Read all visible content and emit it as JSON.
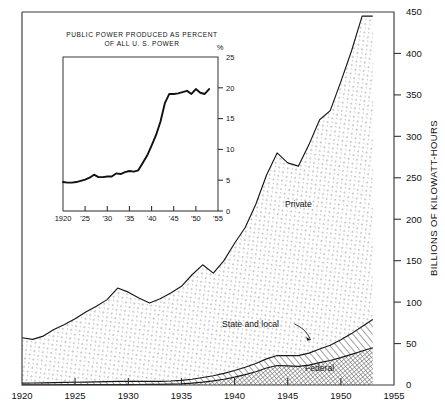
{
  "chart_data": {
    "type": "area",
    "title": "",
    "xlabel": "",
    "ylabel": "BILLIONS OF KILOWATT-HOURS",
    "xlim": [
      1920,
      1955
    ],
    "ylim": [
      0,
      450
    ],
    "xticks": [
      "1920",
      "1925",
      "1930",
      "1935",
      "1940",
      "1945",
      "1950",
      "1955"
    ],
    "yticks": [
      "0",
      "50",
      "100",
      "150",
      "200",
      "250",
      "300",
      "350",
      "400",
      "450"
    ],
    "grid": false,
    "legend_position": "inline-annotations",
    "stacked": true,
    "x": [
      1920,
      1921,
      1922,
      1923,
      1924,
      1925,
      1926,
      1927,
      1928,
      1929,
      1930,
      1931,
      1932,
      1933,
      1934,
      1935,
      1936,
      1937,
      1938,
      1939,
      1940,
      1941,
      1942,
      1943,
      1944,
      1945,
      1946,
      1947,
      1948,
      1949,
      1950,
      1951,
      1952,
      1953
    ],
    "series": [
      {
        "name": "Federal",
        "pattern": "dense-crosshatch",
        "values": [
          0.3,
          0.3,
          0.3,
          0.3,
          0.4,
          0.4,
          0.4,
          0.4,
          0.5,
          0.5,
          0.5,
          0.6,
          0.7,
          0.8,
          1.0,
          1.4,
          2.2,
          3.4,
          5.0,
          7.0,
          9.5,
          12.5,
          16.0,
          20.5,
          23.5,
          23.0,
          22.5,
          24.0,
          27.0,
          29.5,
          33.0,
          37.0,
          41.0,
          45.0
        ]
      },
      {
        "name": "State and local",
        "pattern": "diagonal-hatch",
        "values": [
          2.0,
          2.1,
          2.3,
          2.5,
          2.7,
          2.9,
          3.1,
          3.3,
          3.5,
          3.8,
          3.9,
          3.8,
          3.6,
          3.6,
          3.8,
          4.2,
          4.8,
          5.6,
          6.2,
          7.0,
          8.0,
          9.0,
          10.0,
          11.0,
          12.0,
          12.5,
          13.0,
          14.5,
          16.5,
          18.5,
          21.5,
          25.0,
          29.5,
          34.0
        ]
      },
      {
        "name": "Private",
        "pattern": "fine-dots",
        "values": [
          54.7,
          52.6,
          56.4,
          64.2,
          69.9,
          76.7,
          84.5,
          91.3,
          99.0,
          112.7,
          107.6,
          100.6,
          94.7,
          99.6,
          106.2,
          113.4,
          126.0,
          136.0,
          123.8,
          136.0,
          153.5,
          168.5,
          192.0,
          221.5,
          244.5,
          232.5,
          228.5,
          251.5,
          276.5,
          283.0,
          311.5,
          341.0,
          374.5,
          366.0
        ]
      }
    ],
    "totals": [
      57,
      55,
      59,
      67,
      73,
      80,
      88,
      95,
      103,
      117,
      112,
      105,
      99,
      104,
      111,
      119,
      133,
      145,
      135,
      150,
      171,
      190,
      218,
      253,
      280,
      268,
      264,
      290,
      320,
      331,
      366,
      403,
      445,
      445
    ],
    "annotations": [
      {
        "label": "Private",
        "x": 1946,
        "y": 215
      },
      {
        "label": "State and local",
        "x": 1941.5,
        "y": 70,
        "leader": true
      },
      {
        "label": "Federal",
        "x": 1948,
        "y": 17
      }
    ]
  },
  "inset_chart": {
    "type": "line",
    "title_line1": "PUBLIC POWER PRODUCED AS PERCENT",
    "title_line2": "OF ALL U. S. POWER",
    "unit_symbol": "%",
    "xlabel": "",
    "ylabel": "",
    "xlim": [
      1920,
      1955
    ],
    "ylim": [
      0,
      25
    ],
    "xticks": [
      "1920",
      "'25",
      "'30",
      "'35",
      "'40",
      "'45",
      "'50",
      "'55"
    ],
    "yticks": [
      "0",
      "5",
      "10",
      "15",
      "20",
      "25"
    ],
    "grid": false,
    "x": [
      1920,
      1921,
      1922,
      1923,
      1924,
      1925,
      1926,
      1927,
      1928,
      1929,
      1930,
      1931,
      1932,
      1933,
      1934,
      1935,
      1936,
      1937,
      1938,
      1939,
      1940,
      1941,
      1942,
      1943,
      1944,
      1945,
      1946,
      1947,
      1948,
      1949,
      1950,
      1951,
      1952,
      1953
    ],
    "values": [
      4.7,
      4.6,
      4.6,
      4.7,
      4.9,
      5.1,
      5.4,
      5.9,
      5.5,
      5.5,
      5.6,
      5.6,
      6.1,
      6.0,
      6.3,
      6.5,
      6.4,
      6.6,
      7.8,
      9.0,
      10.6,
      12.3,
      14.5,
      17.5,
      19.0,
      19.0,
      19.1,
      19.3,
      19.5,
      19.0,
      19.8,
      19.2,
      19.0,
      19.8
    ]
  },
  "figure": {
    "background_color": "#ffffff",
    "line_color": "#181818",
    "frame_color": "#3b3b3b"
  }
}
